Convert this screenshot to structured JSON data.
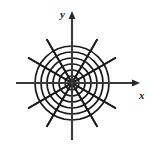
{
  "figure": {
    "name": "polar-coordinate-grid",
    "title": "",
    "background_color": "#ffffff",
    "stroke_color": "#1a1a1a",
    "axis_color": "#3a3a3a",
    "width": 152,
    "height": 154
  },
  "axes": {
    "x_label": "x",
    "y_label": "y",
    "origin": {
      "x": 72,
      "y": 83
    },
    "x_axis": {
      "start_x": 16,
      "end_x": 140,
      "y": 83,
      "arrow": "right"
    },
    "y_axis": {
      "x": 72,
      "start_y": 140,
      "end_y": 11,
      "arrow": "up"
    }
  },
  "chart_data": {
    "type": "line",
    "xlabel": "x",
    "ylabel": "y",
    "grid": true,
    "legend_position": "none",
    "polar_grid": {
      "center": {
        "x": 72,
        "y": 83
      },
      "circle_count": 6,
      "circle_radii": [
        7,
        13,
        19,
        25,
        31,
        37
      ],
      "ray_count": 12,
      "ray_angle_step_degrees": 30,
      "ray_angles_degrees": [
        0,
        30,
        60,
        90,
        120,
        150,
        180,
        210,
        240,
        270,
        300,
        330
      ],
      "ray_length": 50,
      "xlim": [
        -37,
        37
      ],
      "ylim": [
        -37,
        37
      ]
    }
  }
}
